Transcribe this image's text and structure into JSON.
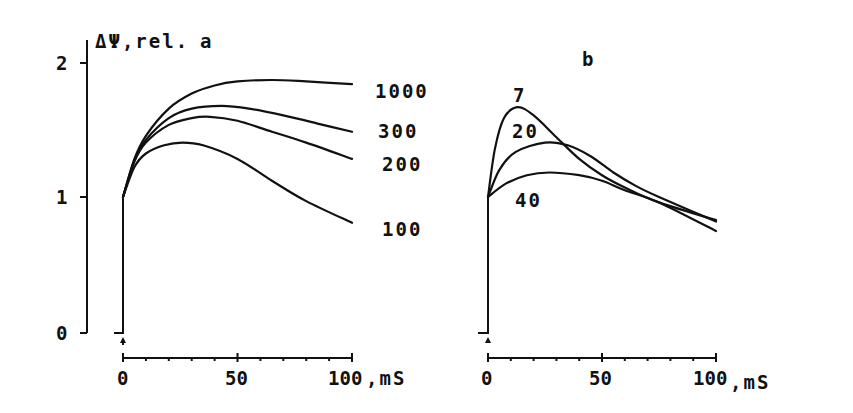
{
  "chart_data": [
    {
      "type": "line",
      "panel": "a",
      "title": "a",
      "ylabel": "ΔΨ, rel.",
      "xlabel": ", mS",
      "xlim": [
        0,
        100
      ],
      "ylim": [
        0,
        2
      ],
      "xticks": [
        "0",
        "50",
        "100"
      ],
      "yticks": [
        "0",
        "1",
        "2"
      ],
      "series": [
        {
          "name": "1000",
          "x": [
            0,
            5,
            10,
            20,
            30,
            40,
            50,
            65,
            80,
            100
          ],
          "values": [
            1.0,
            1.28,
            1.45,
            1.65,
            1.76,
            1.82,
            1.85,
            1.86,
            1.85,
            1.83
          ]
        },
        {
          "name": "300",
          "x": [
            0,
            5,
            10,
            20,
            30,
            43,
            55,
            70,
            85,
            100
          ],
          "values": [
            1.0,
            1.27,
            1.42,
            1.58,
            1.65,
            1.67,
            1.65,
            1.6,
            1.54,
            1.48
          ]
        },
        {
          "name": "200",
          "x": [
            0,
            5,
            10,
            20,
            30,
            38,
            50,
            65,
            80,
            100
          ],
          "values": [
            1.0,
            1.26,
            1.4,
            1.53,
            1.58,
            1.59,
            1.56,
            1.48,
            1.4,
            1.28
          ]
        },
        {
          "name": "100",
          "x": [
            0,
            5,
            10,
            18,
            26,
            35,
            50,
            65,
            80,
            100
          ],
          "values": [
            1.0,
            1.22,
            1.32,
            1.38,
            1.4,
            1.38,
            1.28,
            1.12,
            0.97,
            0.81
          ]
        }
      ]
    },
    {
      "type": "line",
      "panel": "b",
      "title": "b",
      "xlabel": ", mS",
      "xlim": [
        0,
        100
      ],
      "ylim": [
        0,
        2
      ],
      "xticks": [
        "0",
        "50",
        "100"
      ],
      "series": [
        {
          "name": "7",
          "x": [
            0,
            3,
            7,
            13,
            20,
            30,
            40,
            50,
            60,
            75,
            100
          ],
          "values": [
            1.0,
            1.35,
            1.58,
            1.66,
            1.6,
            1.44,
            1.28,
            1.16,
            1.07,
            0.96,
            0.83
          ]
        },
        {
          "name": "20",
          "x": [
            0,
            5,
            12,
            25,
            35,
            45,
            55,
            65,
            75,
            100
          ],
          "values": [
            1.0,
            1.2,
            1.33,
            1.4,
            1.38,
            1.3,
            1.18,
            1.08,
            1.0,
            0.82
          ]
        },
        {
          "name": "40",
          "x": [
            0,
            8,
            17,
            27,
            40,
            50,
            60,
            75,
            100
          ],
          "values": [
            1.0,
            1.1,
            1.16,
            1.18,
            1.16,
            1.12,
            1.05,
            0.96,
            0.75
          ]
        }
      ]
    }
  ],
  "labels": {
    "panel_a": "a",
    "panel_b": "b",
    "ylabel": "ΔΨ,rel.",
    "xunit": ",mS",
    "ytick_0": "0",
    "ytick_1": "1",
    "ytick_2": "2",
    "xtick_0": "0",
    "xtick_50": "50",
    "xtick_100": "100"
  }
}
